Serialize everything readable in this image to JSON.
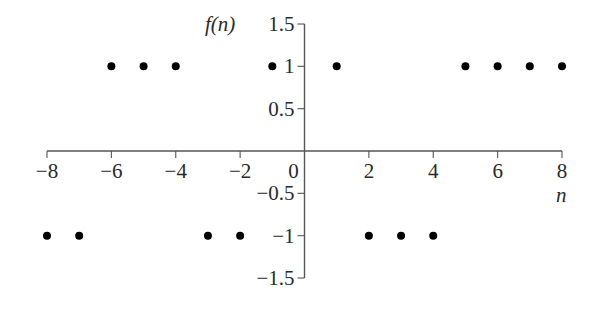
{
  "chart_data": {
    "type": "scatter",
    "title": "",
    "xlabel": "n",
    "ylabel": "f(n)",
    "xlim": [
      -8,
      8
    ],
    "ylim": [
      -1.5,
      1.5
    ],
    "x_ticks": [
      -8,
      -6,
      -4,
      -2,
      0,
      2,
      4,
      6,
      8
    ],
    "x_tick_labels": [
      "−8",
      "−6",
      "−4",
      "−2",
      "0",
      "2",
      "4",
      "6",
      "8"
    ],
    "y_ticks": [
      1.5,
      1,
      0.5,
      -0.5,
      -1,
      -1.5
    ],
    "y_tick_labels": [
      "1.5",
      "1",
      "0.5",
      "−0.5",
      "−1",
      "−1.5"
    ],
    "grid": false,
    "legend": null,
    "series": [
      {
        "name": "f(n)",
        "x": [
          -8,
          -7,
          -6,
          -5,
          -4,
          -3,
          -2,
          -1,
          1,
          2,
          3,
          4,
          5,
          6,
          7,
          8
        ],
        "y": [
          -1,
          -1,
          1,
          1,
          1,
          -1,
          -1,
          1,
          1,
          -1,
          -1,
          -1,
          1,
          1,
          1,
          1
        ]
      }
    ],
    "colors": {
      "axis": "#555555",
      "marker": "#000000",
      "text": "#2a2a2a"
    }
  }
}
